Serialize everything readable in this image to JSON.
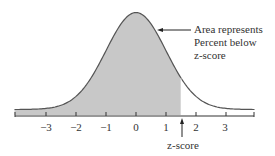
{
  "annotation": {
    "line1": "Area represents",
    "line2": "Percent below",
    "line3": "z-score"
  },
  "axis": {
    "ticks": [
      "−3",
      "−2",
      "−1",
      "0",
      "1",
      "2",
      "3"
    ],
    "marker_label": "z-score",
    "marker_value": 1.5
  },
  "colors": {
    "shade": "#c8c8c8",
    "curve": "#555555",
    "axis": "#333333"
  }
}
